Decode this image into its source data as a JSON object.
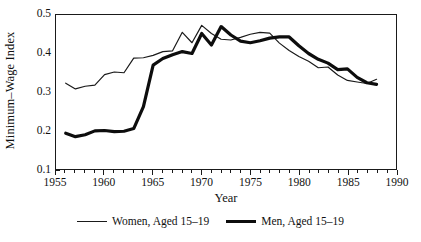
{
  "chart_data": {
    "type": "line",
    "title": "",
    "xlabel": "Year",
    "ylabel": "Minimum–Wage Index",
    "xlim": [
      1955,
      1990
    ],
    "ylim": [
      0.1,
      0.5
    ],
    "xticks": [
      1955,
      1960,
      1965,
      1970,
      1975,
      1980,
      1985,
      1990
    ],
    "xtick_labels": [
      "1955",
      "1960",
      "1965",
      "1970",
      "1975",
      "1980",
      "1985",
      "1990"
    ],
    "xticks_minor_step": 1,
    "yticks": [
      0.1,
      0.2,
      0.3,
      0.4,
      0.5
    ],
    "ytick_labels": [
      "0.1",
      "0.2",
      "0.3",
      "0.4",
      "0.5"
    ],
    "grid": false,
    "legend_position": "below",
    "frame": "box",
    "x": [
      1956,
      1957,
      1958,
      1959,
      1960,
      1961,
      1962,
      1963,
      1964,
      1965,
      1966,
      1967,
      1968,
      1969,
      1970,
      1971,
      1972,
      1973,
      1974,
      1975,
      1976,
      1977,
      1978,
      1979,
      1980,
      1981,
      1982,
      1983,
      1984,
      1985,
      1986,
      1987,
      1988
    ],
    "series": [
      {
        "name": "Women, Aged 15–19",
        "color": "#1a1a1a",
        "line_width": 1.2,
        "values": [
          0.323,
          0.308,
          0.315,
          0.318,
          0.345,
          0.352,
          0.35,
          0.388,
          0.389,
          0.395,
          0.405,
          0.407,
          0.455,
          0.428,
          0.473,
          0.452,
          0.437,
          0.435,
          0.442,
          0.45,
          0.455,
          0.453,
          0.427,
          0.408,
          0.392,
          0.38,
          0.363,
          0.365,
          0.344,
          0.33,
          0.326,
          0.322,
          0.333
        ]
      },
      {
        "name": "Men, Aged 15–19",
        "color": "#0d0d0d",
        "line_width": 3.2,
        "values": [
          0.193,
          0.184,
          0.189,
          0.199,
          0.2,
          0.197,
          0.198,
          0.205,
          0.262,
          0.37,
          0.387,
          0.397,
          0.405,
          0.4,
          0.452,
          0.422,
          0.47,
          0.448,
          0.432,
          0.428,
          0.433,
          0.44,
          0.443,
          0.443,
          0.42,
          0.4,
          0.385,
          0.375,
          0.358,
          0.36,
          0.338,
          0.324,
          0.32
        ]
      }
    ],
    "series_x": [
      {
        "name": "Women, Aged 15–19",
        "x": [
          1956,
          1957,
          1958,
          1959,
          1960,
          1961,
          1962,
          1963,
          1964,
          1965,
          1966,
          1967,
          1968,
          1969,
          1970,
          1971,
          1972,
          1973,
          1974,
          1975,
          1976,
          1977,
          1978,
          1979,
          1980,
          1981,
          1982,
          1983,
          1984,
          1985,
          1986,
          1987,
          1988
        ],
        "y": [
          0.323,
          0.308,
          0.315,
          0.318,
          0.345,
          0.352,
          0.35,
          0.388,
          0.389,
          0.395,
          0.405,
          0.407,
          0.455,
          0.428,
          0.473,
          0.452,
          0.437,
          0.435,
          0.442,
          0.45,
          0.455,
          0.453,
          0.427,
          0.408,
          0.392,
          0.38,
          0.363,
          0.365,
          0.344,
          0.33,
          0.326,
          0.322,
          0.333
        ]
      },
      {
        "name": "Men, Aged 15–19",
        "x": [
          1956,
          1957,
          1958,
          1959,
          1960,
          1961,
          1962,
          1963,
          1964,
          1965,
          1966,
          1967,
          1968,
          1969,
          1970,
          1971,
          1972,
          1973,
          1974,
          1975,
          1976,
          1977,
          1978,
          1979,
          1980,
          1981,
          1982,
          1983,
          1984,
          1985,
          1986,
          1987,
          1988
        ],
        "y": [
          0.193,
          0.184,
          0.189,
          0.199,
          0.2,
          0.197,
          0.198,
          0.205,
          0.262,
          0.37,
          0.387,
          0.397,
          0.405,
          0.4,
          0.452,
          0.422,
          0.47,
          0.448,
          0.432,
          0.428,
          0.433,
          0.44,
          0.443,
          0.443,
          0.42,
          0.4,
          0.385,
          0.375,
          0.358,
          0.36,
          0.338,
          0.324,
          0.32
        ]
      }
    ]
  },
  "legend": {
    "entries": [
      {
        "label": "Women, Aged 15–19",
        "style": "thin"
      },
      {
        "label": "Men, Aged 15–19",
        "style": "thick"
      }
    ]
  }
}
